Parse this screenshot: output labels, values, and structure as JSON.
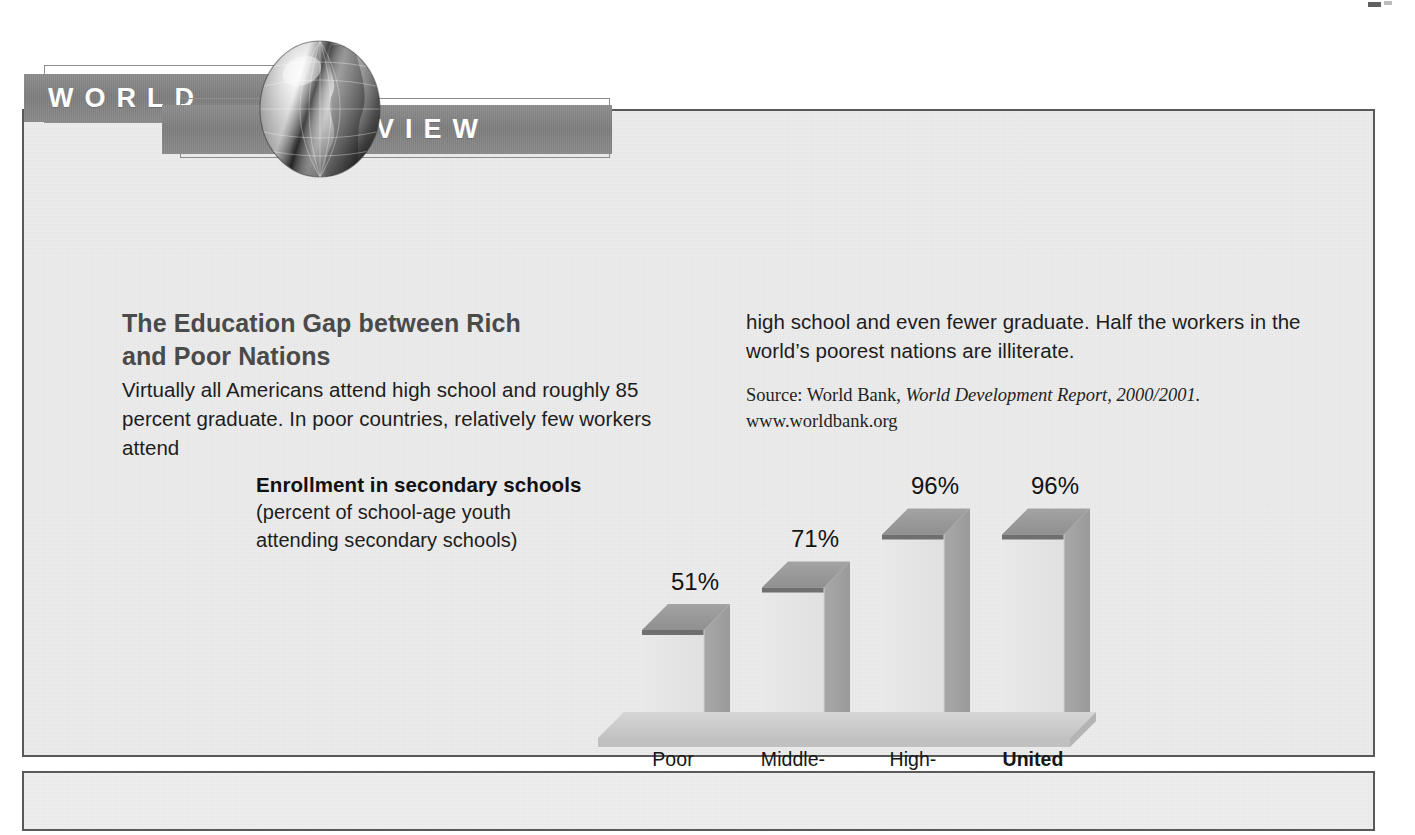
{
  "feature": {
    "banner": {
      "word_1": "WORLD",
      "word_2": "VIEW",
      "globe_icon": "globe-icon"
    },
    "title_line_1": "The Education Gap between Rich",
    "title_line_2": "and Poor Nations",
    "body_left": "Virtually all Americans attend high school and roughly 85 percent graduate. In poor countries, relatively few workers attend",
    "body_right": "high school and even fewer graduate. Half the workers in the world’s poorest nations are illiterate.",
    "source": {
      "prefix": "Source: World Bank, ",
      "title_italic": "World Development Report, 2000/2001.",
      "url": "www.worldbank.org"
    }
  },
  "chart_caption": {
    "title": "Enrollment in secondary schools",
    "sub_line_1": "(percent of school-age youth",
    "sub_line_2": "attending secondary schools)"
  },
  "chart_data": {
    "type": "bar",
    "title": "Enrollment in secondary schools",
    "subtitle": "(percent of school-age youth attending secondary schools)",
    "xlabel": "",
    "ylabel": "percent of school-age youth attending secondary schools",
    "ylim": [
      0,
      100
    ],
    "grid": false,
    "legend": "none",
    "style": "3d-bar",
    "categories": [
      "Poor countries",
      "Middle-income countries",
      "High-income countries",
      "United States"
    ],
    "category_lines": [
      [
        "Poor",
        "countries"
      ],
      [
        "Middle-",
        "income",
        "countries"
      ],
      [
        "High-",
        "income",
        "countries"
      ],
      [
        "United",
        "States"
      ]
    ],
    "category_emphasis": [
      false,
      false,
      false,
      true
    ],
    "values": [
      51,
      71,
      96,
      96
    ],
    "value_labels": [
      "51%",
      "71%",
      "96%",
      "96%"
    ]
  },
  "colors": {
    "banner_bar": "#848484",
    "banner_text": "#ffffff",
    "box_border": "#595959",
    "box_background": "#efefef",
    "title_text": "#4a4a4a",
    "body_text": "#1d1d1d",
    "bar_top": "#9a9a9a",
    "bar_side": "#a0a0a0",
    "bar_front": "#e4e4e4",
    "bar_edge": "#6e6e6e",
    "floor": "#c9c9c9"
  }
}
